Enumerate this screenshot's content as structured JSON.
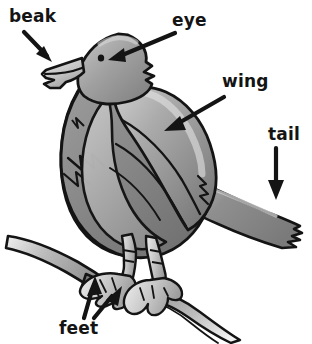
{
  "diagram": {
    "background_color": "#ffffff",
    "outline_color": "#141414",
    "body_gray": "#8a8a8a",
    "body_gray_dark": "#6f6f6f",
    "body_gray_light": "#b9b9b9",
    "highlight_gray": "#d8d8d8",
    "branch_gray": "#9a9a9a",
    "labels": [
      {
        "id": "beak",
        "text": "beak",
        "x": 9,
        "y": 8,
        "arrow": "down-right"
      },
      {
        "id": "eye",
        "text": "eye",
        "x": 172,
        "y": 12,
        "arrow": "down-left"
      },
      {
        "id": "wing",
        "text": "wing",
        "x": 222,
        "y": 73,
        "arrow": "down-left"
      },
      {
        "id": "tail",
        "text": "tail",
        "x": 268,
        "y": 126,
        "arrow": "down"
      },
      {
        "id": "feet",
        "text": "feet",
        "x": 59,
        "y": 320,
        "arrow": "up-left-and-up-right"
      }
    ],
    "parts": [
      "head",
      "beak",
      "eye",
      "breast",
      "wing",
      "tail",
      "left-leg",
      "right-leg",
      "left-foot",
      "right-foot",
      "branch"
    ]
  }
}
